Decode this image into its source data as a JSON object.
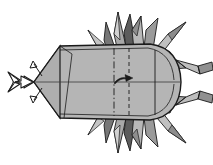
{
  "figure": {
    "title": "Origami insect step diagram",
    "view": "top view",
    "canvas": {
      "width": 213,
      "height": 165,
      "background": "#ffffff"
    }
  },
  "palette": {
    "outline": "#1a1a1a",
    "paper_front": "#b5b5b5",
    "paper_front_light": "#c9c9c9",
    "paper_highlight": "#d8d8d8",
    "paper_mid": "#a0a0a0",
    "paper_shade": "#8a8a8a",
    "paper_dark": "#6a6a6a",
    "paper_darkest": "#4a4a4a",
    "arrow_fill": "#ffffff",
    "fold_line": "#2b2b2b"
  },
  "annotations": {
    "push_arrow": {
      "name": "push-in-arrow",
      "type": "hollow-pleat-arrow",
      "direction": "right",
      "description": "Large hollow outlined arrow pointing right into the head tip"
    },
    "tip_arrow_upper": {
      "name": "small-curved-arrow-upper",
      "type": "curved-fold-arrow",
      "direction": "up-left",
      "description": "Small curved arrow at the head tip pointing up and left"
    },
    "tip_arrow_lower": {
      "name": "small-curved-arrow-lower",
      "type": "curved-fold-arrow",
      "direction": "down-left",
      "description": "Small curved arrow at the head tip pointing down and left"
    },
    "body_arrow": {
      "name": "small-curved-arrow-body",
      "type": "flat-curved-arrow",
      "direction": "right",
      "description": "Small flattened curved arrow on the body centre pointing right"
    },
    "mountain_fold": {
      "name": "mountain-fold-line",
      "style": "dash-dot",
      "orientation": "vertical"
    },
    "valley_fold": {
      "name": "valley-fold-line",
      "style": "dashed",
      "orientation": "vertical"
    },
    "edge_line": {
      "name": "paper-edge-line",
      "style": "solid",
      "orientation": "vertical"
    },
    "center_line": {
      "name": "center-axis-line",
      "style": "solid",
      "orientation": "horizontal"
    }
  },
  "parts": {
    "body": {
      "name": "body-panel",
      "label": "Body"
    },
    "head": {
      "name": "head-tip",
      "label": "Head tip"
    },
    "spikes_top": {
      "name": "spike-cluster-top",
      "label": "Top spike cluster",
      "count": 7
    },
    "spikes_bottom": {
      "name": "spike-cluster-bottom",
      "label": "Bottom spike cluster",
      "count": 7
    },
    "leg_upper": {
      "name": "leg-upper-right",
      "label": "Upper right leg"
    },
    "leg_lower": {
      "name": "leg-lower-right",
      "label": "Lower right leg"
    }
  }
}
